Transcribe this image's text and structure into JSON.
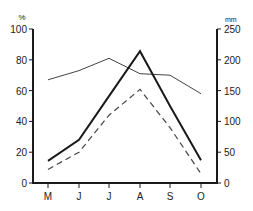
{
  "chart_data": {
    "type": "line",
    "title": "",
    "categories": [
      "M",
      "J",
      "J",
      "A",
      "S",
      "O"
    ],
    "left_axis": {
      "unit_label": "%",
      "ticks": [
        0,
        20,
        40,
        60,
        80,
        100
      ],
      "ylim": [
        0,
        100
      ]
    },
    "right_axis": {
      "unit_label": "mm",
      "ticks": [
        0,
        50,
        100,
        150,
        200,
        250
      ],
      "ylim": [
        0,
        250
      ]
    },
    "series": [
      {
        "name": "thin line (%)",
        "style": "thin-solid",
        "axis": "left",
        "values": [
          67,
          73,
          81,
          71,
          70,
          58
        ]
      },
      {
        "name": "bold line (mm)",
        "style": "bold-solid",
        "axis": "right",
        "values": [
          36,
          70,
          141,
          214,
          125,
          37
        ]
      },
      {
        "name": "dashed line",
        "style": "dashed",
        "axis": "right",
        "values": [
          22,
          50,
          110,
          152,
          90,
          15
        ]
      }
    ],
    "xlabel": "",
    "ylabel": "%",
    "ylabel_right": "mm",
    "grid": false,
    "legend": "none"
  },
  "colors": {
    "line": "#1a1a1a",
    "thin_line": "#444444",
    "axis": "#1a1a1a",
    "background": "#ffffff"
  }
}
